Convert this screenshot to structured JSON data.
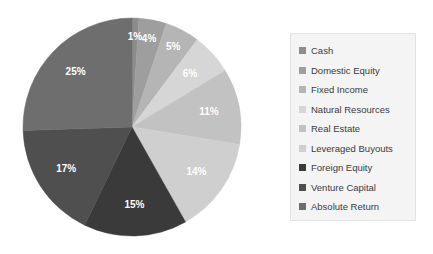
{
  "chart_data": {
    "type": "pie",
    "title": "",
    "subtitle": "",
    "xlabel": "",
    "ylabel": "",
    "grid": false,
    "legend_position": "right",
    "start_angle_deg": 0,
    "direction": "clockwise",
    "value_unit": "percent",
    "categories": [
      "Cash",
      "Domestic Equity",
      "Fixed Income",
      "Natural Resources",
      "Real Estate",
      "Leveraged Buyouts",
      "Foreign Equity",
      "Venture Capital",
      "Absolute Return"
    ],
    "values": [
      1,
      4,
      5,
      6,
      11,
      14,
      15,
      17,
      25
    ],
    "data_labels": [
      "1%",
      "4%",
      "5%",
      "6%",
      "11%",
      "14%",
      "15%",
      "17%",
      "25%"
    ],
    "colors": [
      "#8c8c8c",
      "#9e9e9e",
      "#b5b5b5",
      "#d6d6d6",
      "#c2c2c2",
      "#cfcfcf",
      "#3a3a3a",
      "#4f4f4f",
      "#6e6e6e"
    ],
    "slices": [
      {
        "label": "Cash",
        "value": 1,
        "data_label": "1%",
        "color": "#8c8c8c"
      },
      {
        "label": "Domestic Equity",
        "value": 4,
        "data_label": "4%",
        "color": "#9e9e9e"
      },
      {
        "label": "Fixed Income",
        "value": 5,
        "data_label": "5%",
        "color": "#b5b5b5"
      },
      {
        "label": "Natural Resources",
        "value": 6,
        "data_label": "6%",
        "color": "#d6d6d6"
      },
      {
        "label": "Real Estate",
        "value": 11,
        "data_label": "11%",
        "color": "#c2c2c2"
      },
      {
        "label": "Leveraged Buyouts",
        "value": 14,
        "data_label": "14%",
        "color": "#cfcfcf"
      },
      {
        "label": "Foreign Equity",
        "value": 15,
        "data_label": "15%",
        "color": "#3a3a3a"
      },
      {
        "label": "Venture Capital",
        "value": 17,
        "data_label": "17%",
        "color": "#4f4f4f"
      },
      {
        "label": "Absolute Return",
        "value": 25,
        "data_label": "25%",
        "color": "#6e6e6e"
      }
    ]
  },
  "legend": {
    "items": [
      {
        "label": "Cash",
        "color": "#8c8c8c"
      },
      {
        "label": "Domestic Equity",
        "color": "#9e9e9e"
      },
      {
        "label": "Fixed Income",
        "color": "#b5b5b5"
      },
      {
        "label": "Natural Resources",
        "color": "#d6d6d6"
      },
      {
        "label": "Real Estate",
        "color": "#c2c2c2"
      },
      {
        "label": "Leveraged Buyouts",
        "color": "#cfcfcf"
      },
      {
        "label": "Foreign Equity",
        "color": "#3a3a3a"
      },
      {
        "label": "Venture Capital",
        "color": "#4f4f4f"
      },
      {
        "label": "Absolute Return",
        "color": "#6e6e6e"
      }
    ]
  },
  "canvas": {
    "background": "#ffffff"
  }
}
